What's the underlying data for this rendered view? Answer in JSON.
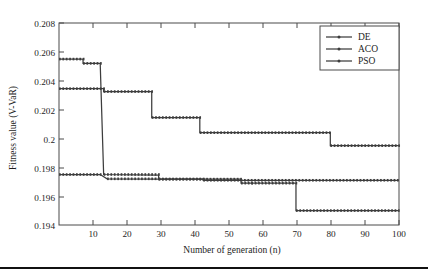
{
  "figure": {
    "background_color": "#ffffff",
    "line_color": "#3d3d3d",
    "frame_color": "#4a4a4a"
  },
  "chart_data": {
    "type": "line",
    "title": "",
    "subtitle": "",
    "xlabel": "Number of generation (n)",
    "ylabel": "Fitness value (V-VaR)",
    "xlim": [
      1,
      100
    ],
    "ylim": [
      0.194,
      0.208
    ],
    "xticks": [
      10,
      20,
      30,
      40,
      50,
      60,
      70,
      80,
      90,
      100
    ],
    "xtick_labels": [
      "10",
      "20",
      "30",
      "40",
      "50",
      "60",
      "70",
      "80",
      "90",
      "100"
    ],
    "yticks": [
      0.194,
      0.196,
      0.198,
      0.2,
      0.202,
      0.204,
      0.206,
      0.208
    ],
    "ytick_labels": [
      "0.194",
      "0.196",
      "0.198",
      "0.2",
      "0.202",
      "0.204",
      "0.206",
      "0.208"
    ],
    "grid": false,
    "legend_position": "top-right",
    "legend_entries": [
      "DE",
      "ACO",
      "PSO"
    ],
    "marker": "dot",
    "series": [
      {
        "name": "DE",
        "x": [
          1,
          8,
          8,
          13,
          13,
          14,
          14,
          30,
          30,
          43,
          43,
          100
        ],
        "values": [
          0.2055,
          0.2055,
          0.2052,
          0.2052,
          0.2052,
          0.1975,
          0.1975,
          0.19745,
          0.19718,
          0.19718,
          0.1971,
          0.1971
        ]
      },
      {
        "name": "ACO",
        "x": [
          1,
          14,
          14,
          28,
          28,
          42,
          42,
          80,
          80,
          100
        ],
        "values": [
          0.20345,
          0.20345,
          0.20325,
          0.20325,
          0.20145,
          0.20145,
          0.2004,
          0.2004,
          0.1995,
          0.1995
        ]
      },
      {
        "name": "PSO",
        "x": [
          1,
          13,
          13,
          15,
          15,
          30,
          30,
          54,
          54,
          57,
          57,
          70,
          70,
          100
        ],
        "values": [
          0.1975,
          0.1975,
          0.1975,
          0.1972,
          0.1972,
          0.19718,
          0.19718,
          0.19718,
          0.1969,
          0.1969,
          0.1969,
          0.1969,
          0.195,
          0.195
        ]
      }
    ]
  }
}
